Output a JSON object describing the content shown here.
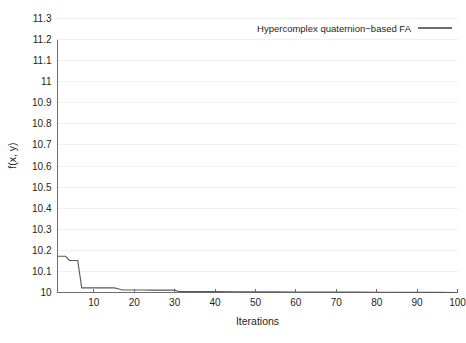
{
  "chart_data": {
    "type": "line",
    "title": "",
    "xlabel": "Iterations",
    "ylabel": "f(x, y)",
    "xlim": [
      1,
      100
    ],
    "ylim": [
      10,
      11.3
    ],
    "grid": "horizontal",
    "legend_position": "top-right",
    "xticks": [
      10,
      20,
      30,
      40,
      50,
      60,
      70,
      80,
      90,
      100
    ],
    "xtick_labels": [
      "10",
      "20",
      "30",
      "40",
      "50",
      "60",
      "70",
      "80",
      "90",
      "100"
    ],
    "yticks": [
      10,
      10.1,
      10.2,
      10.3,
      10.4,
      10.5,
      10.6,
      10.7,
      10.8,
      10.9,
      11,
      11.1,
      11.2,
      11.3
    ],
    "ytick_labels": [
      "10",
      "10.1",
      "10.2",
      "10.3",
      "10.4",
      "10.5",
      "10.6",
      "10.7",
      "10.8",
      "10.9",
      "11",
      "11.1",
      "11.2",
      "11.3"
    ],
    "series": [
      {
        "name": "Hypercomplex quaternion−based FA",
        "color": "#5a5a5a",
        "x": [
          1,
          2,
          3,
          4,
          5,
          6,
          7,
          8,
          9,
          10,
          11,
          12,
          13,
          14,
          15,
          16,
          17,
          18,
          19,
          20,
          22,
          24,
          26,
          28,
          30,
          31,
          33,
          35,
          38,
          40,
          45,
          50,
          55,
          60,
          65,
          70,
          75,
          80,
          85,
          90,
          95,
          100
        ],
        "y": [
          10.172,
          10.172,
          10.172,
          10.152,
          10.152,
          10.152,
          10.022,
          10.022,
          10.022,
          10.022,
          10.022,
          10.022,
          10.022,
          10.022,
          10.022,
          10.018,
          10.012,
          10.012,
          10.012,
          10.012,
          10.012,
          10.011,
          10.011,
          10.011,
          10.011,
          10.005,
          10.004,
          10.004,
          10.004,
          10.004,
          10.0035,
          10.003,
          10.003,
          10.0025,
          10.002,
          10.002,
          10.0015,
          10.001,
          10.001,
          10.0008,
          10.0005,
          10.0002
        ]
      }
    ]
  },
  "legend": {
    "entries": [
      {
        "label": "Hypercomplex quaternion−based FA"
      }
    ]
  },
  "axes": {
    "x_title": "Iterations",
    "y_title": "f(x, y)"
  }
}
